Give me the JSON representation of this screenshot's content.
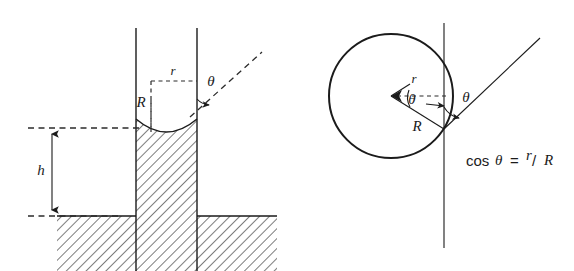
{
  "figure": {
    "background_color": "#ffffff",
    "ink_color": "#1b1b1b",
    "panels": [
      {
        "id": "left",
        "name": "capillary-rise-panel",
        "description": "Capillary tube standing in a liquid reservoir, liquid risen to height h with a concave meniscus"
      },
      {
        "id": "right",
        "name": "meniscus-sphere-panel",
        "description": "Sphere of radius R inscribed against the tube wall showing cos theta = r over R"
      }
    ]
  },
  "left_panel": {
    "labels": {
      "height": "h",
      "tube_radius": "r",
      "meniscus_radius": "R",
      "contact_angle": "θ"
    },
    "parts": {
      "tube_wall_left": "tube-wall-left",
      "tube_wall_right": "tube-wall-right",
      "meniscus": "meniscus-arc",
      "liquid_column": "liquid-column-hatched",
      "reservoir": "liquid-reservoir-hatched",
      "level_line_top": "meniscus-level-dashed-line",
      "level_line_bottom": "reservoir-level-dashed-line",
      "height_dimension": "height-dimension-arrow",
      "radius_box": "radius-construction-dashed-box",
      "tangent_line": "tangent-dashed-line",
      "angle_arc": "contact-angle-arc"
    }
  },
  "right_panel": {
    "labels": {
      "tube_radius": "r",
      "sphere_radius": "R",
      "center_angle": "θ",
      "contact_angle": "θ"
    },
    "equation": {
      "function": "cos",
      "angle": "θ",
      "equals": "=",
      "numerator": "r",
      "slash": "/",
      "denominator": "R",
      "full_text": "cos θ = r/R"
    },
    "parts": {
      "circle": "meniscus-sphere-circle",
      "vertical_line": "tube-wall-vertical-line",
      "horizontal_dashed": "radius-horizontal-dashed-line",
      "radius_line": "sphere-radius-line",
      "tangent_line": "tangent-line",
      "center_angle_arc": "center-angle-arc",
      "contact_angle_arc": "contact-angle-arc"
    }
  }
}
